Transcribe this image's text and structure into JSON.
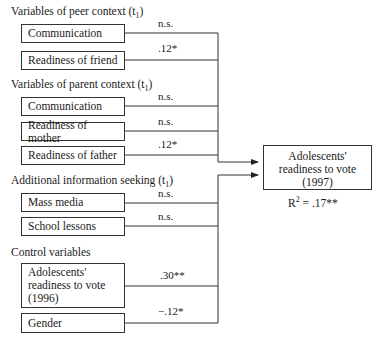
{
  "groups": [
    {
      "label": "Variables of peer context (t",
      "label_sub": "1",
      "items": [
        {
          "label": "Communication",
          "coef": "n.s."
        },
        {
          "label": "Readiness of friend",
          "coef": ".12*"
        }
      ]
    },
    {
      "label": "Variables of parent context (t",
      "label_sub": "1",
      "items": [
        {
          "label": "Communication",
          "coef": "n.s."
        },
        {
          "label": "Readiness of mother",
          "coef": "n.s."
        },
        {
          "label": "Readiness of father",
          "coef": ".12*"
        }
      ]
    },
    {
      "label": "Additional information seeking (t",
      "label_sub": "1",
      "items": [
        {
          "label": "Mass media",
          "coef": "n.s."
        },
        {
          "label": "School lessons",
          "coef": "n.s."
        }
      ]
    },
    {
      "label": "Control variables",
      "items": [
        {
          "label_lines": [
            "Adolescents'",
            "readiness to vote",
            "(1996)"
          ],
          "coef": ".30**"
        },
        {
          "label": "Gender",
          "coef": "−.12*"
        }
      ]
    }
  ],
  "outcome": {
    "lines": [
      "Adolescents'",
      "readiness to vote",
      "(1997)"
    ],
    "r2_prefix": "R",
    "r2_sup": "2",
    "r2_value": " = .17**"
  },
  "colors": {
    "line": "#333333",
    "text": "#1a1a1a",
    "background": "#ffffff"
  }
}
